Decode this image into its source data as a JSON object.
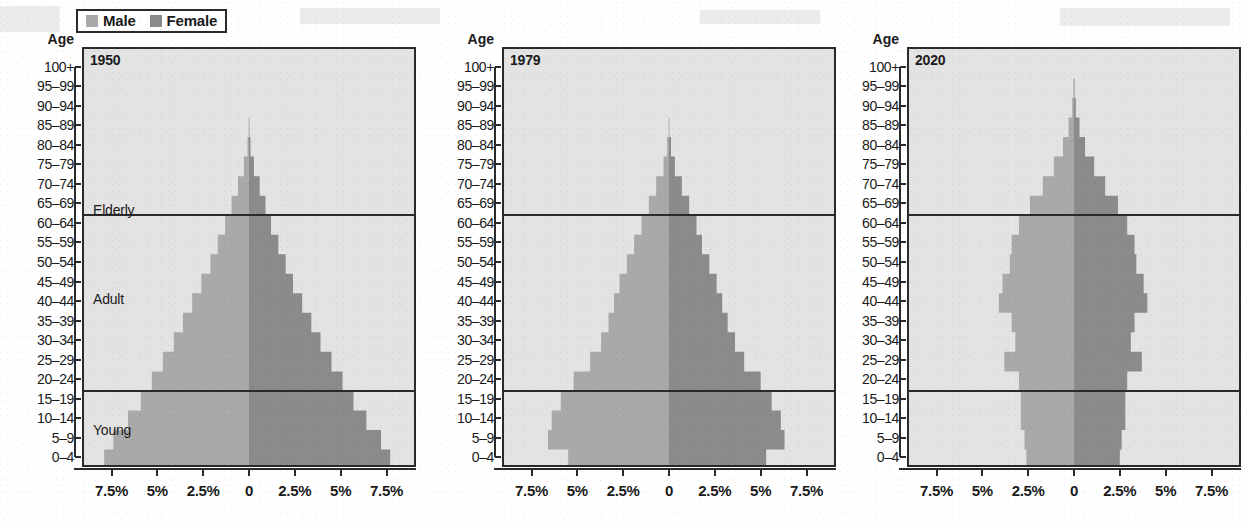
{
  "legend": {
    "items": [
      {
        "label": "Male",
        "color": "#a9a9a9",
        "swatch_name": "legend-swatch-male"
      },
      {
        "label": "Female",
        "color": "#8b8b8b",
        "swatch_name": "legend-swatch-female"
      }
    ]
  },
  "axis": {
    "head": "Age",
    "age_labels": [
      "100+",
      "95–99",
      "90–94",
      "85–89",
      "80–84",
      "75–79",
      "70–74",
      "65–69",
      "60–64",
      "55–59",
      "50–54",
      "45–49",
      "40–44",
      "35–39",
      "30–34",
      "25–29",
      "20–24",
      "15–19",
      "10–14",
      "5–9",
      "0–4"
    ],
    "x_tick_labels": [
      "7.5%",
      "5%",
      "2.5%",
      "0",
      "2.5%",
      "5%",
      "7.5%"
    ],
    "x_tick_values": [
      -7.5,
      -5,
      -2.5,
      0,
      2.5,
      5,
      7.5
    ],
    "xlim": [
      -9.0,
      9.0
    ],
    "grid": false
  },
  "group_labels": {
    "elderly": "Elderly",
    "adult": "Adult",
    "young": "Young",
    "boundary_elderly_adult": "65–69 / 60–64",
    "boundary_adult_young": "20–24 / 15–19"
  },
  "colors": {
    "male": "#a9a9a9",
    "female": "#8b8b8b",
    "plot_background": "#e3e3e3",
    "ink": "#2a2a2a",
    "page": "#ffffff"
  },
  "chart_data": [
    {
      "type": "bar",
      "title": "1950",
      "orientation": "population-pyramid",
      "xlabel": "",
      "ylabel": "Age",
      "xlim": [
        -9.0,
        9.0
      ],
      "grid": false,
      "legend_position": "top-left",
      "categories": [
        "0–4",
        "5–9",
        "10–14",
        "15–19",
        "20–24",
        "25–29",
        "30–34",
        "35–39",
        "40–44",
        "45–49",
        "50–54",
        "55–59",
        "60–64",
        "65–69",
        "70–74",
        "75–79",
        "80–84",
        "85–89",
        "90–94",
        "95–99",
        "100+"
      ],
      "series": [
        {
          "name": "Male",
          "values": [
            7.9,
            7.4,
            6.6,
            5.9,
            5.3,
            4.7,
            4.1,
            3.6,
            3.1,
            2.6,
            2.1,
            1.7,
            1.3,
            0.95,
            0.6,
            0.28,
            0.08,
            0.02,
            0.0,
            0.0,
            0.0
          ]
        },
        {
          "name": "Female",
          "values": [
            7.7,
            7.2,
            6.4,
            5.7,
            5.1,
            4.5,
            3.9,
            3.4,
            2.9,
            2.4,
            2.0,
            1.6,
            1.2,
            0.9,
            0.58,
            0.27,
            0.08,
            0.02,
            0.0,
            0.0,
            0.0
          ]
        }
      ]
    },
    {
      "type": "bar",
      "title": "1979",
      "orientation": "population-pyramid",
      "xlabel": "",
      "ylabel": "Age",
      "xlim": [
        -9.0,
        9.0
      ],
      "grid": false,
      "legend_position": "top-left",
      "categories": [
        "0–4",
        "5–9",
        "10–14",
        "15–19",
        "20–24",
        "25–29",
        "30–34",
        "35–39",
        "40–44",
        "45–49",
        "50–54",
        "55–59",
        "60–64",
        "65–69",
        "70–74",
        "75–79",
        "80–84",
        "85–89",
        "90–94",
        "95–99",
        "100+"
      ],
      "series": [
        {
          "name": "Male",
          "values": [
            5.5,
            6.6,
            6.4,
            5.9,
            5.2,
            4.3,
            3.7,
            3.3,
            3.0,
            2.7,
            2.3,
            1.9,
            1.5,
            1.1,
            0.7,
            0.3,
            0.1,
            0.02,
            0.0,
            0.0,
            0.0
          ]
        },
        {
          "name": "Female",
          "values": [
            5.3,
            6.3,
            6.1,
            5.6,
            5.0,
            4.1,
            3.6,
            3.2,
            2.9,
            2.6,
            2.2,
            1.8,
            1.5,
            1.1,
            0.7,
            0.32,
            0.11,
            0.02,
            0.0,
            0.0,
            0.0
          ]
        }
      ]
    },
    {
      "type": "bar",
      "title": "2020",
      "orientation": "population-pyramid",
      "xlabel": "",
      "ylabel": "Age",
      "xlim": [
        -9.0,
        9.0
      ],
      "grid": false,
      "legend_position": "top-left",
      "categories": [
        "0–4",
        "5–9",
        "10–14",
        "15–19",
        "20–24",
        "25–29",
        "30–34",
        "35–39",
        "40–44",
        "45–49",
        "50–54",
        "55–59",
        "60–64",
        "65–69",
        "70–74",
        "75–79",
        "80–84",
        "85–89",
        "90–94",
        "95–99",
        "100+"
      ],
      "series": [
        {
          "name": "Male",
          "values": [
            2.6,
            2.7,
            2.9,
            2.9,
            3.0,
            3.8,
            3.2,
            3.4,
            4.1,
            3.9,
            3.5,
            3.4,
            3.0,
            2.4,
            1.7,
            1.1,
            0.6,
            0.3,
            0.1,
            0.03,
            0.0
          ]
        },
        {
          "name": "Female",
          "values": [
            2.5,
            2.6,
            2.8,
            2.8,
            2.9,
            3.7,
            3.1,
            3.3,
            4.0,
            3.8,
            3.4,
            3.3,
            2.9,
            2.4,
            1.7,
            1.1,
            0.6,
            0.3,
            0.1,
            0.03,
            0.0
          ]
        }
      ]
    }
  ]
}
